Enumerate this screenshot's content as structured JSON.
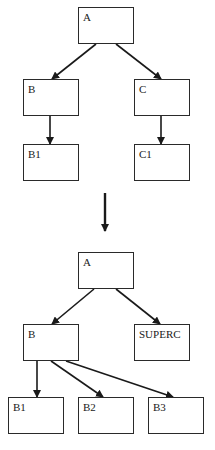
{
  "before": {
    "nodes": [
      {
        "id": "A",
        "label": "A",
        "x": 78,
        "y": 7,
        "w": 56,
        "h": 37
      },
      {
        "id": "B",
        "label": "B",
        "x": 23,
        "y": 79,
        "w": 56,
        "h": 37
      },
      {
        "id": "C",
        "label": "C",
        "x": 134,
        "y": 79,
        "w": 56,
        "h": 37
      },
      {
        "id": "B1",
        "label": "B1",
        "x": 23,
        "y": 144,
        "w": 56,
        "h": 37
      },
      {
        "id": "C1",
        "label": "C1",
        "x": 134,
        "y": 144,
        "w": 56,
        "h": 37
      }
    ],
    "edges": [
      [
        "A",
        "B"
      ],
      [
        "A",
        "C"
      ],
      [
        "B",
        "B1"
      ],
      [
        "C",
        "C1"
      ]
    ]
  },
  "transition": {
    "direction": "down"
  },
  "after": {
    "nodes": [
      {
        "id": "A",
        "label": "A",
        "x": 78,
        "y": 252,
        "w": 56,
        "h": 37
      },
      {
        "id": "B",
        "label": "B",
        "x": 23,
        "y": 324,
        "w": 56,
        "h": 37
      },
      {
        "id": "SUPERC",
        "label": "SUPERC",
        "x": 134,
        "y": 324,
        "w": 56,
        "h": 37
      },
      {
        "id": "B1",
        "label": "B1",
        "x": 8,
        "y": 397,
        "w": 56,
        "h": 37
      },
      {
        "id": "B2",
        "label": "B2",
        "x": 78,
        "y": 397,
        "w": 56,
        "h": 37
      },
      {
        "id": "B3",
        "label": "B3",
        "x": 148,
        "y": 397,
        "w": 56,
        "h": 37
      }
    ],
    "edges": [
      [
        "A",
        "B"
      ],
      [
        "A",
        "SUPERC"
      ],
      [
        "B",
        "B1"
      ],
      [
        "B",
        "B2"
      ],
      [
        "B",
        "B3"
      ]
    ]
  }
}
